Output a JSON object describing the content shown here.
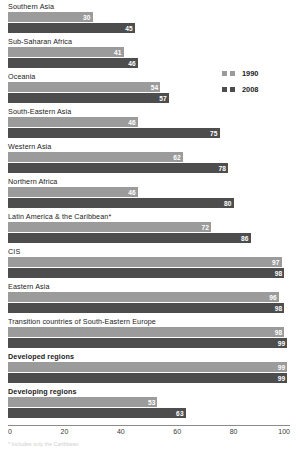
{
  "legend": {
    "entries": [
      {
        "label": "1990",
        "color": "#9b9b9b"
      },
      {
        "label": "2008",
        "color": "#4d4d4d"
      }
    ]
  },
  "axis": {
    "ticks": [
      "0",
      "20",
      "40",
      "60",
      "80",
      "100"
    ],
    "min": 0,
    "max": 100
  },
  "footnote": {
    "text": "* Includes only the Caribbean"
  },
  "chart_data": {
    "type": "bar",
    "orientation": "horizontal",
    "title": "",
    "xlabel": "",
    "ylabel": "",
    "xlim": [
      0,
      100
    ],
    "grid": false,
    "legend_position": "top-right",
    "categories": [
      "Southern Asia",
      "Sub-Saharan Africa",
      "Oceania",
      "South-Eastern Asia",
      "Western Asia",
      "Northern Africa",
      "Latin America & the Caribbean*",
      "CIS",
      "Eastern Asia",
      "Transition countries of South-Eastern Europe",
      "Developed regions",
      "Developing regions"
    ],
    "bold_categories": [
      "Developed regions",
      "Developing regions"
    ],
    "series": [
      {
        "name": "1990",
        "color": "#9b9b9b",
        "values": [
          30,
          41,
          54,
          46,
          62,
          46,
          72,
          97,
          96,
          98,
          99,
          53
        ]
      },
      {
        "name": "2008",
        "color": "#4d4d4d",
        "values": [
          45,
          46,
          57,
          75,
          78,
          80,
          86,
          98,
          98,
          99,
          99,
          63
        ]
      }
    ]
  }
}
